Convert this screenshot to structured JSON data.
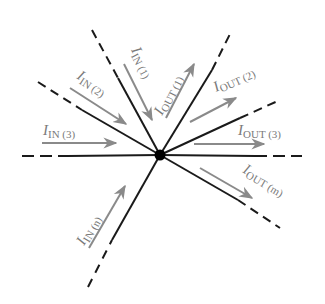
{
  "diagram": {
    "type": "kirchhoff-current-junction",
    "node": {
      "x": 160,
      "y": 155,
      "r": 5,
      "color": "#000000"
    },
    "colors": {
      "wire": "#1a1a1a",
      "arrow": "#8a8a8a",
      "label": "#7a7a7a"
    },
    "branches": [
      {
        "id": "in-1",
        "far": [
          92,
          30
        ],
        "solid_from": [
          118,
          78
        ],
        "dashed": true
      },
      {
        "id": "in-2",
        "far": [
          38,
          82
        ],
        "solid_from": [
          82,
          110
        ],
        "dashed": true
      },
      {
        "id": "in-3",
        "far": [
          22,
          156
        ],
        "solid_from": [
          68,
          156
        ],
        "dashed": true
      },
      {
        "id": "in-n",
        "far": [
          88,
          287
        ],
        "solid_from": [
          112,
          240
        ],
        "dashed": true
      },
      {
        "id": "out-1",
        "far": [
          232,
          30
        ],
        "solid_from": [
          212,
          70
        ],
        "dashed": true
      },
      {
        "id": "out-2",
        "far": [
          280,
          100
        ],
        "solid_from": [
          240,
          118
        ],
        "dashed": true
      },
      {
        "id": "out-3",
        "far": [
          302,
          156
        ],
        "solid_from": [
          255,
          156
        ],
        "dashed": true
      },
      {
        "id": "out-m",
        "far": [
          280,
          228
        ],
        "solid_from": [
          238,
          200
        ],
        "dashed": true
      }
    ],
    "labels": {
      "in_1": {
        "main": "I",
        "sub": "IN (1)"
      },
      "in_2": {
        "main": "I",
        "sub": "IN (2)"
      },
      "in_3": {
        "main": "I",
        "sub": "IN (3)"
      },
      "in_n": {
        "main": "I",
        "sub": "IN (n)"
      },
      "out_1": {
        "main": "I",
        "sub": "OUT (1)"
      },
      "out_2": {
        "main": "I",
        "sub": "OUT (2)"
      },
      "out_3": {
        "main": "I",
        "sub": "OUT (3)"
      },
      "out_m": {
        "main": "I",
        "sub": "OUT (m)"
      }
    }
  }
}
